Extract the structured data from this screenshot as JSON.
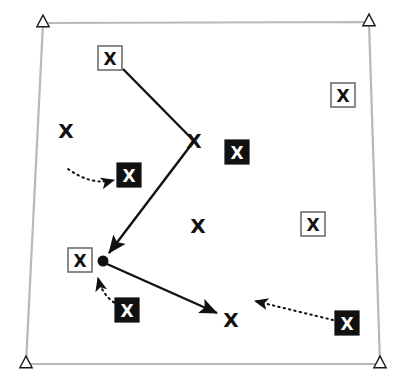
{
  "figure": {
    "width": 409,
    "height": 387,
    "background_color": "#ffffff",
    "glyph_label": "X"
  },
  "boundary": {
    "name": "survey-area-quadrilateral",
    "stroke_color": "#b9b9b9",
    "stroke_width": 2.2,
    "fill": "none",
    "corners": [
      {
        "label": "top-left",
        "x": 43,
        "y": 23
      },
      {
        "label": "top-right",
        "x": 369,
        "y": 22
      },
      {
        "label": "bottom-right",
        "x": 380,
        "y": 364
      },
      {
        "label": "bottom-left",
        "x": 26,
        "y": 364
      }
    ]
  },
  "corner_markers": {
    "name": "corner-triangle-markers",
    "shape": "open-triangle",
    "stroke_color": "#1a1a1a",
    "fill_color": "#ffffff",
    "size": 11,
    "points": [
      {
        "label": "corner-marker-top-left",
        "x": 43,
        "y": 23
      },
      {
        "label": "corner-marker-top-right",
        "x": 369,
        "y": 22
      },
      {
        "label": "corner-marker-bottom-right",
        "x": 380,
        "y": 364
      },
      {
        "label": "corner-marker-bottom-left",
        "x": 26,
        "y": 364
      }
    ]
  },
  "markers": {
    "boxed": {
      "style_name": "boxed-x-marker",
      "box_fill": "#ffffff",
      "box_stroke": "#6f6f6f",
      "glyph_color": "#111111",
      "box_size": 24,
      "items": [
        {
          "id": "boxed-x-1",
          "x": 110,
          "y": 58
        },
        {
          "id": "boxed-x-2",
          "x": 343,
          "y": 95
        },
        {
          "id": "boxed-x-3",
          "x": 313,
          "y": 224
        },
        {
          "id": "boxed-x-4",
          "x": 80,
          "y": 260
        }
      ]
    },
    "filled": {
      "style_name": "filled-x-marker",
      "box_fill": "#111111",
      "box_stroke": "#111111",
      "glyph_color": "#ffffff",
      "box_size": 24,
      "items": [
        {
          "id": "filled-x-1",
          "x": 129,
          "y": 175
        },
        {
          "id": "filled-x-2",
          "x": 237,
          "y": 152
        },
        {
          "id": "filled-x-3",
          "x": 127,
          "y": 310
        },
        {
          "id": "filled-x-4",
          "x": 347,
          "y": 323
        }
      ]
    },
    "plain": {
      "style_name": "plain-x-marker",
      "glyph_color": "#111111",
      "items": [
        {
          "id": "plain-x-1",
          "x": 66,
          "y": 131
        },
        {
          "id": "plain-x-2",
          "x": 194,
          "y": 141
        },
        {
          "id": "plain-x-3",
          "x": 198,
          "y": 226
        },
        {
          "id": "plain-x-4",
          "x": 231,
          "y": 320
        }
      ]
    }
  },
  "node": {
    "name": "track-node-dot",
    "x": 103,
    "y": 261,
    "radius": 5.5,
    "fill_color": "#111111"
  },
  "solid_path": {
    "name": "solid-track-polyline",
    "stroke_color": "#111111",
    "stroke_width": 2.4,
    "arrowheads": [
      "at-node",
      "at-end"
    ],
    "points": [
      {
        "x": 123,
        "y": 69
      },
      {
        "x": 194,
        "y": 141
      },
      {
        "x": 103,
        "y": 261
      },
      {
        "x": 231,
        "y": 320
      }
    ]
  },
  "dotted_arrows": [
    {
      "id": "dotted-arrow-left",
      "stroke_color": "#111111",
      "stroke_width": 2.0,
      "dash": "1.5 4",
      "from": {
        "x": 68,
        "y": 169
      },
      "control": {
        "x": 92,
        "y": 186
      },
      "to": {
        "x": 114,
        "y": 180
      }
    },
    {
      "id": "dotted-arrow-bottom-left",
      "stroke_color": "#111111",
      "stroke_width": 2.0,
      "dash": "1.5 4",
      "from": {
        "x": 119,
        "y": 305
      },
      "control": {
        "x": 103,
        "y": 298
      },
      "to": {
        "x": 98,
        "y": 278
      }
    },
    {
      "id": "dotted-arrow-bottom-right",
      "stroke_color": "#111111",
      "stroke_width": 2.0,
      "dash": "1.5 4",
      "from": {
        "x": 333,
        "y": 320
      },
      "control": {
        "x": 300,
        "y": 312
      },
      "to": {
        "x": 255,
        "y": 301
      }
    }
  ]
}
